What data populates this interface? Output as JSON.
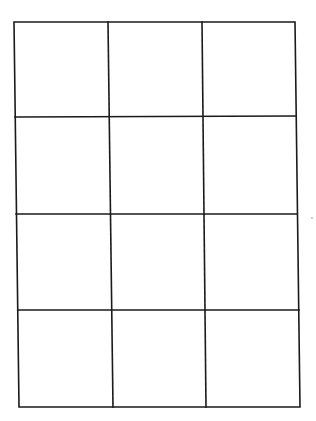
{
  "diagram": {
    "type": "grid",
    "rows": 4,
    "columns": 3,
    "cells": 12,
    "line_color": "#1a1a1a",
    "background": "#ffffff",
    "cell_labels": []
  }
}
